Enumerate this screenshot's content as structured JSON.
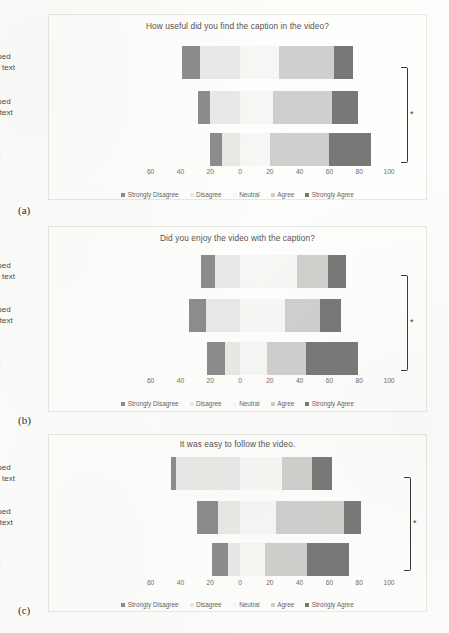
{
  "figure": {
    "captions": {
      "a": "(a)",
      "b": "(b)",
      "c": "(c)"
    },
    "significance_marker": "*",
    "axis_ticks": [
      "60",
      "40",
      "20",
      "0",
      "20",
      "40",
      "60",
      "80",
      "100"
    ],
    "category_labels": [
      "Captions overlapped\nwith scrolling news text",
      "Captions overlapped\nwith current news text",
      "Captions with\nno overlapping"
    ],
    "legend": [
      {
        "label": "Strongly Disagree",
        "color": "#8c8c8c"
      },
      {
        "label": "Disagree",
        "color": "#e9e9e7"
      },
      {
        "label": "Neutral",
        "color": "#f7f7f5"
      },
      {
        "label": "Agree",
        "color": "#cfcfcd"
      },
      {
        "label": "Strongly Agree",
        "color": "#787877"
      }
    ],
    "colors": {
      "strongly_disagree": "#8c8c8c",
      "disagree": "#e9e9e7",
      "neutral": "#f7f7f5",
      "agree": "#cfcfcd",
      "strongly_agree": "#787877",
      "panel_border": "#e7e7e4",
      "text": "#4c4a47",
      "bracket": "#3b3937"
    }
  },
  "chart_data": [
    {
      "id": "a",
      "type": "bar",
      "orientation": "horizontal",
      "stacked": "diverging-likert",
      "title": "How useful did you find the caption in the video?",
      "caption": "(a)",
      "xlabel": "",
      "ylabel": "",
      "xlim": [
        -60,
        100
      ],
      "xticks": [
        -60,
        -40,
        -20,
        0,
        20,
        40,
        60,
        80,
        100
      ],
      "xticklabels": [
        "60",
        "40",
        "20",
        "0",
        "20",
        "40",
        "60",
        "80",
        "100"
      ],
      "grid": false,
      "legend_position": "bottom",
      "categories": [
        "Captions overlapped with scrolling news text",
        "Captions overlapped with current news text",
        "Captions with no overlapping"
      ],
      "series": [
        {
          "name": "Strongly Disagree",
          "values": [
            12,
            8,
            8
          ]
        },
        {
          "name": "Disagree",
          "values": [
            27,
            20,
            12
          ]
        },
        {
          "name": "Neutral",
          "values": [
            26,
            22,
            20
          ]
        },
        {
          "name": "Agree",
          "values": [
            37,
            40,
            40
          ]
        },
        {
          "name": "Strongly Agree",
          "values": [
            13,
            17,
            28
          ]
        }
      ],
      "bar_left_start": [
        -39,
        -28,
        -20
      ],
      "bar_right_end": [
        63,
        68,
        88
      ],
      "significance_bracket": {
        "from": "Captions overlapped with scrolling news text",
        "to": "Captions with no overlapping",
        "marker": "*"
      }
    },
    {
      "id": "b",
      "type": "bar",
      "orientation": "horizontal",
      "stacked": "diverging-likert",
      "title": "Did you enjoy the video with the caption?",
      "caption": "(b)",
      "xlabel": "",
      "ylabel": "",
      "xlim": [
        -60,
        100
      ],
      "xticks": [
        -60,
        -40,
        -20,
        0,
        20,
        40,
        60,
        80,
        100
      ],
      "xticklabels": [
        "60",
        "40",
        "20",
        "0",
        "20",
        "40",
        "60",
        "80",
        "100"
      ],
      "grid": false,
      "legend_position": "bottom",
      "categories": [
        "Captions overlapped with scrolling news text",
        "Captions overlapped with current news text",
        "Captions with no overlapping"
      ],
      "series": [
        {
          "name": "Strongly Disagree",
          "values": [
            9,
            11,
            12
          ]
        },
        {
          "name": "Disagree",
          "values": [
            17,
            23,
            10
          ]
        },
        {
          "name": "Neutral",
          "values": [
            38,
            30,
            18
          ]
        },
        {
          "name": "Agree",
          "values": [
            21,
            24,
            26
          ]
        },
        {
          "name": "Strongly Agree",
          "values": [
            12,
            14,
            35
          ]
        }
      ],
      "bar_left_start": [
        -26,
        -34,
        -22
      ],
      "bar_right_end": [
        71,
        68,
        79
      ],
      "significance_bracket": {
        "from": "Captions overlapped with scrolling news text",
        "to": "Captions with no overlapping",
        "marker": "*"
      }
    },
    {
      "id": "c",
      "type": "bar",
      "orientation": "horizontal",
      "stacked": "diverging-likert",
      "title": "It was easy to follow the video.",
      "caption": "(c)",
      "xlabel": "",
      "ylabel": "",
      "xlim": [
        -60,
        100
      ],
      "xticks": [
        -60,
        -40,
        -20,
        0,
        20,
        40,
        60,
        80,
        100
      ],
      "xticklabels": [
        "60",
        "40",
        "20",
        "0",
        "20",
        "40",
        "60",
        "80",
        "100"
      ],
      "grid": false,
      "legend_position": "bottom",
      "categories": [
        "Captions overlapped with scrolling news text",
        "Captions overlapped with current news text",
        "Captions with no overlapping"
      ],
      "series": [
        {
          "name": "Strongly Disagree",
          "values": [
            3,
            14,
            11
          ]
        },
        {
          "name": "Disagree",
          "values": [
            43,
            15,
            8
          ]
        },
        {
          "name": "Neutral",
          "values": [
            28,
            24,
            17
          ]
        },
        {
          "name": "Agree",
          "values": [
            20,
            46,
            28
          ]
        },
        {
          "name": "Strongly Agree",
          "values": [
            14,
            11,
            28
          ]
        }
      ],
      "bar_left_start": [
        -46,
        -29,
        -19
      ],
      "bar_right_end": [
        56,
        76,
        84
      ],
      "significance_bracket": {
        "from": "Captions overlapped with scrolling news text",
        "to": "Captions with no overlapping",
        "marker": "*"
      }
    }
  ]
}
